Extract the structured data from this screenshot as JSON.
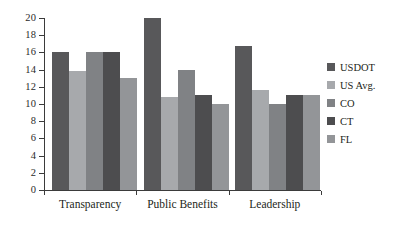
{
  "chart_data": {
    "type": "bar",
    "title": "",
    "subtitle": "",
    "xlabel": "",
    "ylabel": "",
    "ylim": [
      0,
      20
    ],
    "ytick_step": 2,
    "yticks": [
      0,
      2,
      4,
      6,
      8,
      10,
      12,
      14,
      16,
      18,
      20
    ],
    "grid": false,
    "legend_position": "right",
    "categories": [
      "Transparency",
      "Public Benefits",
      "Leadership"
    ],
    "series": [
      {
        "name": "USDOT",
        "color": "#58585a",
        "values": [
          16,
          20,
          16.8
        ]
      },
      {
        "name": "US Avg.",
        "color": "#a7a9ac",
        "values": [
          13.8,
          10.8,
          11.6
        ]
      },
      {
        "name": "CO",
        "color": "#808285",
        "values": [
          16,
          14,
          10
        ]
      },
      {
        "name": "CT",
        "color": "#4d4d4f",
        "values": [
          16,
          11,
          11
        ]
      },
      {
        "name": "FL",
        "color": "#939598",
        "values": [
          13,
          10,
          11
        ]
      }
    ]
  },
  "axis": {
    "y_tick_labels": [
      "20",
      "18",
      "16",
      "14",
      "12",
      "10",
      "8",
      "6",
      "4",
      "2",
      "0"
    ]
  },
  "legend": {
    "items": [
      {
        "label": "USDOT",
        "color": "#58585a"
      },
      {
        "label": "US Avg.",
        "color": "#a7a9ac"
      },
      {
        "label": "CO",
        "color": "#808285"
      },
      {
        "label": "CT",
        "color": "#4d4d4f"
      },
      {
        "label": "FL",
        "color": "#939598"
      }
    ]
  }
}
